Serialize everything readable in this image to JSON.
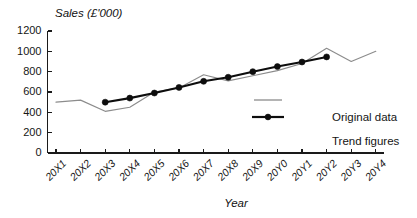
{
  "chart_data": {
    "type": "line",
    "title": "Sales (£'000)",
    "xlabel": "Year",
    "ylabel": "",
    "ylim": [
      0,
      1200
    ],
    "yticks": [
      0,
      200,
      400,
      600,
      800,
      1000,
      1200
    ],
    "grid": false,
    "legend_position": "right-middle",
    "categories": [
      "20X1",
      "20X2",
      "20X3",
      "20X4",
      "20X5",
      "20X6",
      "20X7",
      "20X8",
      "20X9",
      "20Y0",
      "20Y1",
      "20Y2",
      "20Y3",
      "20Y4"
    ],
    "series": [
      {
        "name": "Original data",
        "style": "thin-line",
        "color": "#8c8c8c",
        "markers": false,
        "values": [
          500,
          520,
          410,
          450,
          600,
          640,
          770,
          710,
          760,
          810,
          880,
          1030,
          900,
          1000
        ]
      },
      {
        "name": "Trend figures",
        "style": "thick-line-with-markers",
        "color": "#0d0d0d",
        "markers": true,
        "values": [
          null,
          null,
          500,
          540,
          590,
          645,
          705,
          745,
          800,
          850,
          895,
          945,
          null,
          null
        ]
      }
    ]
  },
  "legend": {
    "entries": [
      {
        "label": "Original data",
        "swatch": "thin-gray-line"
      },
      {
        "label": "Trend figures",
        "swatch": "thick-black-line-with-dot"
      }
    ]
  },
  "axis": {
    "y_tick_labels": [
      "1200",
      "1000",
      "800",
      "600",
      "400",
      "200",
      "0"
    ],
    "x_tick_labels": [
      "20X1",
      "20X2",
      "20X3",
      "20X4",
      "20X5",
      "20X6",
      "20X7",
      "20X8",
      "20X9",
      "20Y0",
      "20Y1",
      "20Y2",
      "20Y3",
      "20Y4"
    ],
    "y_axis_title": "Sales (£'000)",
    "x_axis_title": "Year"
  }
}
